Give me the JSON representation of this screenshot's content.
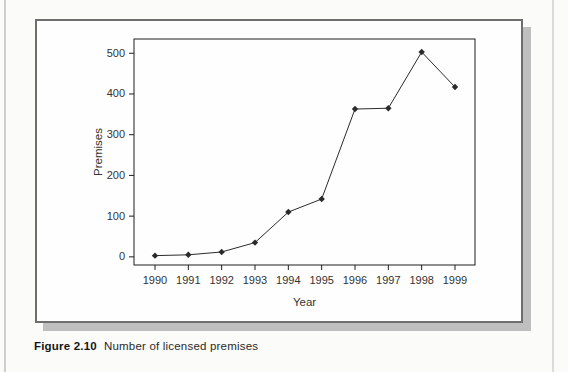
{
  "caption": {
    "label": "Figure 2.10",
    "text": "Number of licensed premises"
  },
  "chart_data": {
    "type": "line",
    "title": "",
    "xlabel": "Year",
    "ylabel": "Premises",
    "x": [
      1990,
      1991,
      1992,
      1993,
      1994,
      1995,
      1996,
      1997,
      1998,
      1999
    ],
    "series": [
      {
        "name": "Premises",
        "values": [
          3,
          5,
          12,
          35,
          110,
          142,
          363,
          365,
          503,
          417
        ]
      }
    ],
    "xticks": [
      1990,
      1991,
      1992,
      1993,
      1994,
      1995,
      1996,
      1997,
      1998,
      1999
    ],
    "yticks": [
      0,
      100,
      200,
      300,
      400,
      500
    ],
    "xlim": [
      1989.37,
      1999.6
    ],
    "ylim": [
      -20,
      535
    ],
    "grid": false,
    "legend": "none",
    "marker": "diamond",
    "line_color": "#2b2b2b",
    "axis_color": "#1f1f1f",
    "tick_label_color": "#333333"
  },
  "colors": {
    "page_background": "#fbfbf9",
    "figure_background": "#fefefe",
    "figure_border": "#6e6e6e",
    "figure_shadow": "#bfbfbf"
  }
}
